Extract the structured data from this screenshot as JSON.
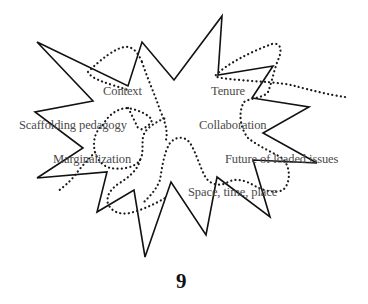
{
  "diagram": {
    "labels": {
      "context": "Context",
      "tenure": "Tenure",
      "scaffolding": "Scaffolding pedagogy",
      "collaboration": "Collaboration",
      "marginalization": "Marginalization",
      "future": "Future of loaded issues",
      "space": "Space, time, place"
    },
    "page_number": "9",
    "colors": {
      "outline": "#111111",
      "dotted": "#1a1a1a",
      "label": "#4a4a4a"
    },
    "shapes": {
      "burst": "solid jagged starburst outline",
      "blob": "dotted irregular loop"
    }
  }
}
